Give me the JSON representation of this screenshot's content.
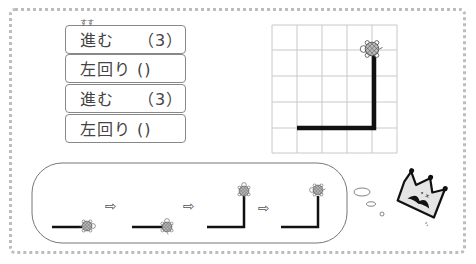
{
  "commands": [
    {
      "label": "進む",
      "ruby": "すす",
      "arg": "（3）"
    },
    {
      "label": "左回り ()",
      "ruby": "",
      "arg": ""
    },
    {
      "label": "進む",
      "ruby": "",
      "arg": "（3）"
    },
    {
      "label": "左回り ()",
      "ruby": "",
      "arg": ""
    }
  ],
  "grid": {
    "cols": 5,
    "rows": 5
  },
  "colors": {
    "line": "#111111",
    "grid": "#c8c8c8",
    "border": "#bdbdbd",
    "shell": "#9a9a9a"
  },
  "arrows": [
    "⇨",
    "⇨",
    "⇨"
  ],
  "decoration": {
    "crown_character": "crown-with-mustache"
  }
}
